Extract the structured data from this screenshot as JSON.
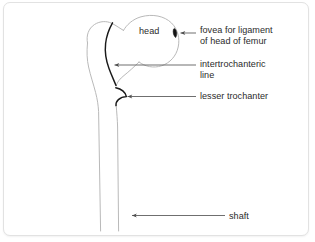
{
  "figure": {
    "view": "anterior view of right femur, upper end",
    "panel": {
      "background_color": "#ffffff",
      "border_color": "#e2e2e2"
    }
  },
  "labels": {
    "head": "head",
    "fovea_line1": "fovea for ligament",
    "fovea_line2": "of head of femur",
    "intertrochanteric_line1": "intertrochanteric",
    "intertrochanteric_line2": "line",
    "lesser_trochanter": "lesser trochanter",
    "shaft": "shaft"
  },
  "colors": {
    "text": "#2b2b2b",
    "bone_outline": "#b8b8b8",
    "highlight_stroke": "#1a1a1a",
    "leader_line": "#555555",
    "fovea_fill": "#141414"
  },
  "annotations": [
    {
      "name": "head",
      "label": "head",
      "kind": "inline-label",
      "has_leader": false
    },
    {
      "name": "fovea-for-ligament-of-head-of-femur",
      "label": "fovea for ligament of head of femur",
      "kind": "leader-arrow",
      "arrow_direction": "left",
      "target": "small dark pit on lateral aspect of femoral head"
    },
    {
      "name": "intertrochanteric-line",
      "label": "intertrochanteric line",
      "kind": "leader-arrow",
      "arrow_direction": "left",
      "target": "dark curved ridge between greater and lesser trochanter"
    },
    {
      "name": "lesser-trochanter",
      "label": "lesser trochanter",
      "kind": "leader-arrow",
      "arrow_direction": "left",
      "target": "dark hooked prominence below neck, medial side"
    },
    {
      "name": "shaft",
      "label": "shaft",
      "kind": "leader-arrow",
      "arrow_direction": "left",
      "target": "long cylindrical body of femur"
    }
  ]
}
